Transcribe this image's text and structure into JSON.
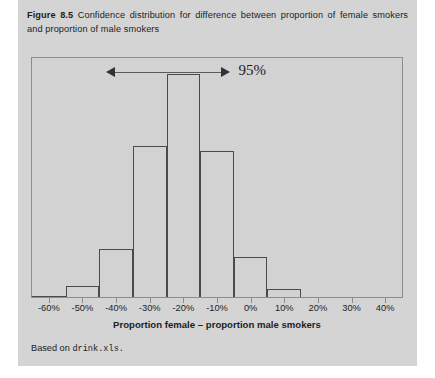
{
  "figure": {
    "label": "Figure 8.5",
    "caption": "Confidence distribution for difference between proportion of female smokers and proportion of male smokers",
    "source_prefix": "Based on",
    "source_file": "drink.xls",
    "source_suffix": "."
  },
  "annotation": {
    "ci_label": "95%",
    "ci_low_percent": -43,
    "ci_high_percent": -6
  },
  "colors": {
    "card_background": "#d4d4d4",
    "plot_background": "#d2d2d2",
    "plot_border": "#8d8d8d",
    "bar_outline": "#4a4a4a",
    "text": "#1d1d1d"
  },
  "chart_data": {
    "type": "bar",
    "title": "",
    "xlabel": "Proportion female – proportion male smokers",
    "ylabel": "",
    "xlim": [
      -65,
      45
    ],
    "grid": false,
    "legend": null,
    "tick_labels": [
      "-60%",
      "-50%",
      "-40%",
      "-30%",
      "-20%",
      "-10%",
      "0%",
      "10%",
      "20%",
      "30%",
      "40%"
    ],
    "tick_values": [
      -60,
      -50,
      -40,
      -30,
      -20,
      -10,
      0,
      10,
      20,
      30,
      40
    ],
    "bin_edges": [
      -65,
      -55,
      -45,
      -35,
      -25,
      -15,
      -5,
      5,
      15
    ],
    "categories": [
      "-65% to -55%",
      "-55% to -45%",
      "-45% to -35%",
      "-35% to -25%",
      "-25% to -15%",
      "-15% to -5%",
      "-5% to 5%",
      "5% to 15%"
    ],
    "values": [
      0,
      4,
      18,
      57,
      84,
      55,
      15,
      3
    ],
    "ylim": [
      0,
      90
    ]
  }
}
